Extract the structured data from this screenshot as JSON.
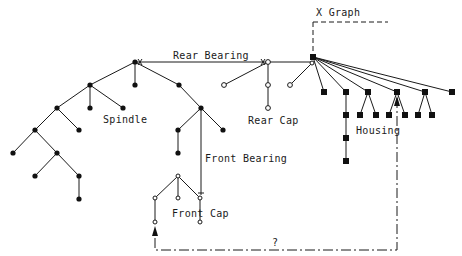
{
  "labels": {
    "x_graph": "X Graph",
    "rear_bearing": "Rear Bearing",
    "spindle": "Spindle",
    "rear_cap": "Rear Cap",
    "housing": "Housing",
    "front_bearing": "Front Bearing",
    "front_cap": "Front Cap",
    "unknown_link": "?"
  },
  "colors": {
    "ink": "#1a1a1a",
    "background": "#ffffff"
  },
  "trees": {
    "spindle": {
      "node_style": "filled-circle",
      "root": [
        135,
        62
      ]
    },
    "rear_cap": {
      "node_style": "open-circle",
      "root": [
        268,
        62
      ]
    },
    "front_cap": {
      "node_style": "open-circle",
      "root": [
        178,
        176
      ]
    },
    "housing": {
      "node_style": "filled-square",
      "root": [
        313,
        57
      ]
    }
  }
}
